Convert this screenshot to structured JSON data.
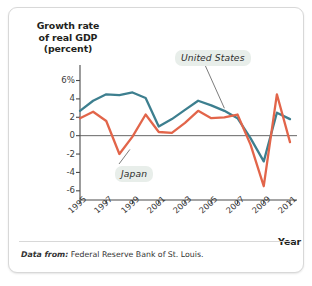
{
  "figure": {
    "y_axis_title_lines": [
      "Growth rate",
      "of real GDP",
      "(percent)"
    ],
    "x_axis_name": "Year",
    "source_prefix": "Data from:",
    "source_text": "Federal Reserve Bank of St. Louis.",
    "colors": {
      "united_states": "#3d7f8f",
      "japan": "#e2654a",
      "axis": "#4a4a4a",
      "label_background": "#e8eeea",
      "card_border": "#d8d8d8"
    }
  },
  "chart_data": {
    "type": "line",
    "title": "",
    "subtitle": "",
    "xlabel": "Year",
    "ylabel": "Growth rate of real GDP (percent)",
    "xlim": [
      1995,
      2011
    ],
    "ylim": [
      -7,
      6.6
    ],
    "yticks": [
      6,
      4,
      2,
      0,
      -2,
      -4,
      -6
    ],
    "ytick_labels": [
      "6%",
      "4",
      "2",
      "0",
      "-2",
      "-4",
      "-6"
    ],
    "xticks": [
      1995,
      1997,
      1999,
      2001,
      2003,
      2005,
      2007,
      2009,
      2011
    ],
    "xtick_labels": [
      "1995",
      "1997",
      "1999",
      "2001",
      "2003",
      "2005",
      "2007",
      "2009",
      "2011"
    ],
    "grid": false,
    "zero_line": true,
    "legend": "inline-annotations",
    "x": [
      1995,
      1996,
      1997,
      1998,
      1999,
      2000,
      2001,
      2002,
      2003,
      2004,
      2005,
      2006,
      2007,
      2008,
      2009,
      2010,
      2011
    ],
    "series": [
      {
        "name": "United States",
        "color": "#3d7f8f",
        "values": [
          2.7,
          3.8,
          4.5,
          4.4,
          4.7,
          4.1,
          1.0,
          1.8,
          2.8,
          3.8,
          3.3,
          2.7,
          1.9,
          -0.3,
          -2.8,
          2.5,
          1.8
        ],
        "label": "United States",
        "label_anchor": {
          "x": 2006.0,
          "y": 3.2
        }
      },
      {
        "name": "Japan",
        "color": "#e2654a",
        "values": [
          1.9,
          2.6,
          1.6,
          -2.0,
          -0.1,
          2.3,
          0.4,
          0.3,
          1.4,
          2.7,
          1.9,
          2.0,
          2.3,
          -1.0,
          -5.5,
          4.5,
          -0.7
        ],
        "label": "Japan",
        "label_anchor": {
          "x": 1998.8,
          "y": -1.5
        }
      }
    ]
  }
}
